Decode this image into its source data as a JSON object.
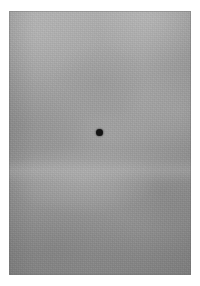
{
  "image": {
    "kind": "photographic-gray-field",
    "width": 200,
    "height": 286,
    "background_color": "#ffffff",
    "caption": ""
  },
  "panel": {
    "name": "gray-field",
    "left": 9,
    "top": 11,
    "width": 182,
    "height": 264,
    "base_color": "#9a9a9a",
    "top_tone": "#b0b0b0",
    "bottom_tone": "#858585",
    "texture": "mottled cloudy grain",
    "edge_color": "#6e6e6e"
  },
  "marker": {
    "name": "fixation-dot",
    "shape": "circle",
    "center_x": 99,
    "center_y": 132,
    "diameter": 7,
    "color": "#141414"
  },
  "labels": {
    "alt_text": "Uniform mottled gray field with a single small black fixation dot near the center."
  }
}
